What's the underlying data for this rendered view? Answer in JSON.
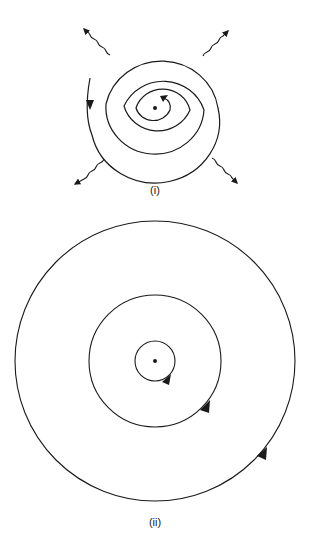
{
  "diagram": {
    "panels": [
      {
        "label": "(i)",
        "description": "Classical orbit: electron spirals inward toward nucleus while radiating (wavy arrows)",
        "center": [
          155,
          108
        ],
        "spiral_turns": 3.5,
        "outer_radius": 55,
        "radiation_arrows": 4
      },
      {
        "label": "(ii)",
        "description": "Stable concentric circular orbits around nucleus, each with direction arrow",
        "center": [
          155,
          361
        ],
        "orbit_radii": [
          20,
          66,
          140
        ]
      }
    ],
    "colors": {
      "stroke": "#1a1a1a",
      "background": "#ffffff"
    }
  }
}
